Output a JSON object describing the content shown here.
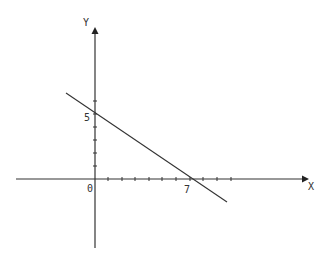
{
  "diagram": {
    "type": "coordinate-plane",
    "axes": {
      "x_label": "X",
      "y_label": "Y",
      "origin_label": "0"
    },
    "line": {
      "x_intercept_label": "7",
      "y_intercept_label": "5",
      "x_intercept": 7,
      "y_intercept": 5,
      "slope": "negative",
      "color": "#333333"
    },
    "axis_color": "#333333"
  }
}
